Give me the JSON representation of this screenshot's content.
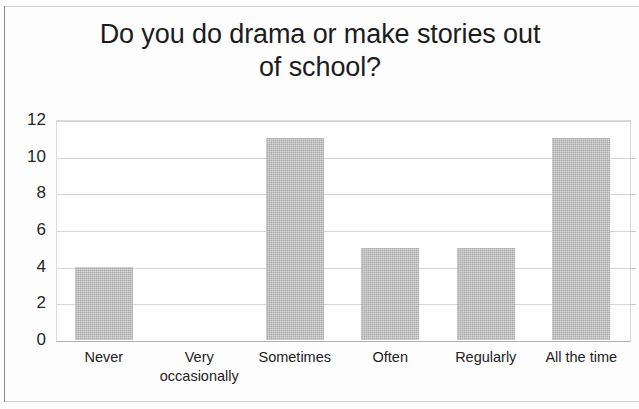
{
  "chart_data": {
    "type": "bar",
    "title": "Do you do drama or make stories out of school?",
    "title_lines": [
      "Do you do drama or make stories out",
      "of school?"
    ],
    "categories": [
      "Never",
      "Very occasionally",
      "Sometimes",
      "Often",
      "Regularly",
      "All the time"
    ],
    "category_lines": [
      [
        "Never"
      ],
      [
        "Very",
        "occasionally"
      ],
      [
        "Sometimes"
      ],
      [
        "Often"
      ],
      [
        "Regularly"
      ],
      [
        "All the time"
      ]
    ],
    "values": [
      4,
      0,
      11,
      5,
      5,
      11
    ],
    "xlabel": "",
    "ylabel": "",
    "ylim": [
      0,
      12
    ],
    "ytick_step": 2,
    "yticks": [
      12,
      10,
      8,
      6,
      4,
      2,
      0
    ],
    "grid": true,
    "grid_orientation": "horizontal",
    "legend": false,
    "bar_color": "#bcbcbc",
    "grid_color": "#d5d5d5",
    "text_color": "#1c1c1c"
  }
}
